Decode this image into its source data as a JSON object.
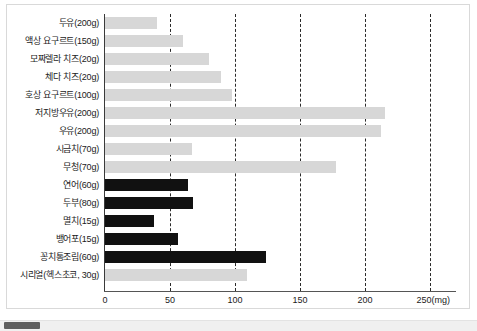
{
  "chart_data": {
    "type": "bar",
    "orientation": "horizontal",
    "title": "",
    "xlabel": "250(mg)",
    "ylabel": "",
    "xlim": [
      0,
      250
    ],
    "grid": true,
    "gridlines": [
      50,
      100,
      150,
      200,
      250
    ],
    "xticks": [
      "0",
      "50",
      "100",
      "150",
      "200",
      "250(mg)"
    ],
    "xtick_values": [
      0,
      50,
      100,
      150,
      200,
      250
    ],
    "unit": "mg",
    "legend_position": "none",
    "categories": [
      "두유(200g)",
      "액상 요구르트(150g)",
      "모짜렐라 치즈(20g)",
      "체다 치즈(20g)",
      "호상 요구르트(100g)",
      "저지방우유(200g)",
      "우유(200g)",
      "시금치(70g)",
      "무청(70g)",
      "연어(60g)",
      "두부(80g)",
      "멸치(15g)",
      "뱅어포(15g)",
      "꽁치통조림(60g)",
      "시리얼(헥스초코, 30g)"
    ],
    "values": [
      40,
      60,
      80,
      89,
      98,
      215,
      212,
      67,
      178,
      64,
      68,
      38,
      56,
      124,
      109
    ],
    "colors": [
      "light",
      "light",
      "light",
      "light",
      "light",
      "light",
      "light",
      "light",
      "light",
      "dark",
      "dark",
      "dark",
      "dark",
      "dark",
      "light"
    ],
    "palette": {
      "light": "#d7d7d7",
      "dark": "#111111",
      "gridline": "#2a2a2a",
      "axis": "#3a3a3a",
      "text": "#1b1b1b",
      "background": "#ffffff",
      "frame": "#d9d9d9"
    }
  },
  "scrollbar": {
    "thumb_color": "#5f5f5f",
    "track_color": "#f0f0f0"
  }
}
